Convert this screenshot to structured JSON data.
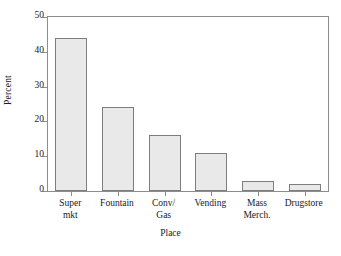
{
  "chart_data": {
    "type": "bar",
    "title": "",
    "subtitle": "",
    "xlabel": "Place",
    "ylabel": "Percent",
    "categories": [
      "Super mkt",
      "Fountain",
      "Conv/ Gas",
      "Vending",
      "Mass Merch.",
      "Drugstore"
    ],
    "category_lines": [
      [
        "Super",
        "mkt"
      ],
      [
        "Fountain"
      ],
      [
        "Conv/",
        "Gas"
      ],
      [
        "Vending"
      ],
      [
        "Mass",
        "Merch."
      ],
      [
        "Drugstore"
      ]
    ],
    "values": [
      44,
      24,
      16,
      11,
      3,
      2
    ],
    "ylim": [
      0,
      50
    ],
    "yticks": [
      0,
      10,
      20,
      30,
      40,
      50
    ],
    "ytick_labels": [
      "0",
      "10",
      "20",
      "30",
      "40",
      "50"
    ],
    "grid": false,
    "legend": false,
    "legend_position": "none",
    "colors": {
      "bar_fill": "#e9e9e9",
      "bar_edge": "#7d7d7d",
      "axis": "#8d8d8d",
      "text": "#1a1a1a",
      "background": "#ffffff"
    }
  }
}
